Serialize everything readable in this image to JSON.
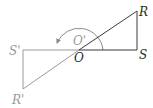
{
  "diagram": {
    "type": "geometry-rotation",
    "labels": {
      "R": "R",
      "S": "S",
      "O": "O",
      "O_prime": "O'",
      "S_prime": "S'",
      "R_prime": "R'"
    },
    "points": {
      "R": [
        137,
        11
      ],
      "S": [
        137,
        50
      ],
      "O": [
        79,
        50
      ],
      "S_prime": [
        23,
        50
      ],
      "R_prime": [
        23,
        89
      ]
    },
    "colors": {
      "original": "#3a3a3a",
      "image": "#9a9a9a",
      "arc": "#8a8a8a"
    }
  }
}
